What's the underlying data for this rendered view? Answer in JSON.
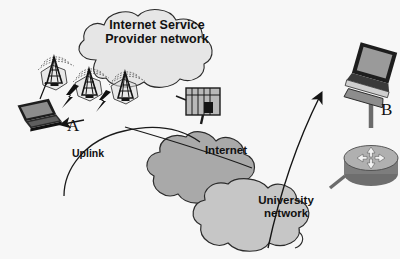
{
  "diagram": {
    "background": "#ffffff",
    "scan_tint": "#f7f7f7",
    "labels": {
      "isp_cloud": "Internet Service\nProvider network",
      "internet_cloud": "Internet",
      "university_cloud": "University\nnetwork",
      "uplink": "Uplink",
      "node_a": "A",
      "node_b": "B"
    },
    "colors": {
      "isp_cloud_fill": "#e6e6e6",
      "internet_cloud_fill": "#a9a9a9",
      "university_cloud_fill": "#c6c6c6",
      "cloud_stroke": "#2b2b2b",
      "cell_fill": "#d8d8d8",
      "tower_dark": "#1c1c1c",
      "router_body": "#9a9a9a",
      "router_top": "#b5b5b5",
      "device_dark": "#2a2a2a",
      "device_screen": "#8f8f8f",
      "link_line": "#1a1a1a",
      "text": "#111111"
    },
    "icons": [
      {
        "name": "laptop-icon",
        "label": "A",
        "role": "wireless client laptop"
      },
      {
        "name": "cell-tower-icon",
        "count": 3,
        "role": "ISP base stations in hexagonal cells"
      },
      {
        "name": "radio-waves-icon",
        "count": 3,
        "role": "wireless signal arcs above towers"
      },
      {
        "name": "lightning-bolt-icon",
        "count": 2,
        "role": "wireless association links"
      },
      {
        "name": "switch-icon",
        "role": "ISP edge switch"
      },
      {
        "name": "router-icon",
        "role": "university border router"
      },
      {
        "name": "desktop-computer-icon",
        "label": "B",
        "role": "destination host"
      }
    ],
    "links": [
      {
        "name": "uplink-curve",
        "from": "A",
        "to": "Internet",
        "label": "Uplink"
      },
      {
        "name": "isp-to-internet-line",
        "from": "switch",
        "to": "Internet"
      },
      {
        "name": "traffic-arrow",
        "from": "University network",
        "to": "B"
      },
      {
        "name": "router-to-b-line",
        "from": "router",
        "to": "B"
      },
      {
        "name": "router-to-university-line",
        "from": "router",
        "to": "University network"
      }
    ]
  }
}
